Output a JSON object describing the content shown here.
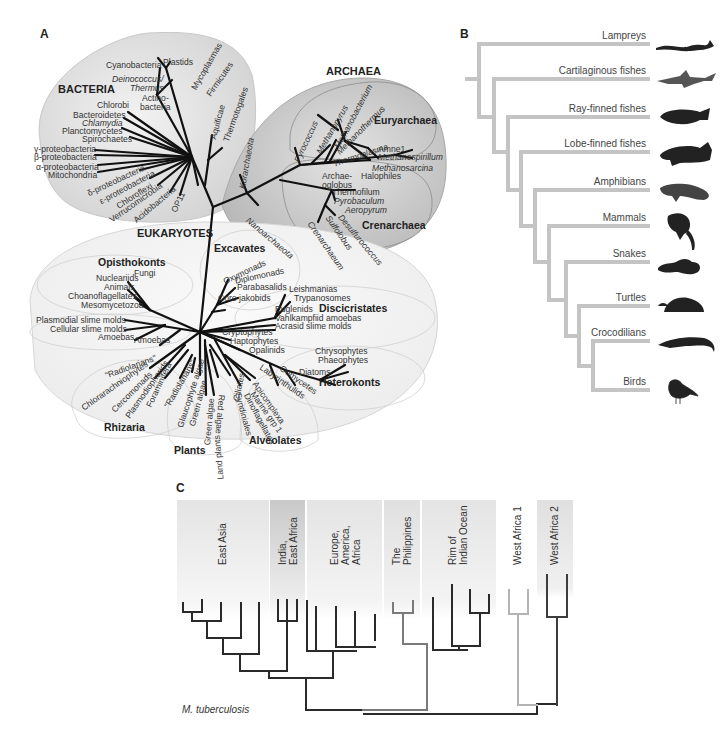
{
  "panels": {
    "A": {
      "letter": "A",
      "domains": {
        "bacteria": {
          "title": "BACTERIA",
          "taxa": [
            "Cyanobacteria",
            "Plastids",
            "Deinococcus/",
            "Thermus",
            "Actino-",
            "bacteria",
            "Mycoplasmas",
            "Firmicutes",
            "Chlorobi",
            "Bacteroidetes",
            "Chlamydia",
            "Planctomycetes",
            "Spirochaetes",
            "γ-proteobacteria",
            "β-proteobacteria",
            "α-proteobacteria",
            "Mitochondria",
            "δ-proteobacteria",
            "ε-proteobacteria",
            "Chloroflexi",
            "Verrucomicrobia",
            "Acidobacteria",
            "OP11",
            "Aquificae",
            "Thermotogales"
          ]
        },
        "archaea": {
          "title": "ARCHAEA",
          "euryarchaea": {
            "title": "Euryarchaea",
            "taxa": [
              "Pyrococcus",
              "Methanopyrus",
              "Methanobacterium",
              "Methanothermus",
              "Thermoplasma",
              "Amne1",
              "Methanospirillum",
              "Methanosarcina",
              "Halophiles",
              "Archae-",
              "oglobus"
            ]
          },
          "crenarchaea": {
            "title": "Crenarchaea",
            "taxa": [
              "Thermofilum",
              "Pyrobaculum",
              "Aeropyrum",
              "Desulfurococcus",
              "Sulfolobus",
              "Crenarchaeum"
            ]
          },
          "other": [
            "Korarchaeota",
            "Nanoarchaeota"
          ]
        },
        "eukaryotes": {
          "title": "EUKARYOTES",
          "opisthokonts": {
            "title": "Opisthokonts",
            "taxa": [
              "Nucleariids",
              "Fungi",
              "Animals",
              "Choanoflagellates",
              "Mesomycetozoa"
            ]
          },
          "amoebozoa": {
            "taxa": [
              "Plasmodial slime molds",
              "Cellular slime molds",
              "Amoebas",
              "Amoebas"
            ]
          },
          "excavates": {
            "title": "Excavates",
            "taxa": [
              "Oxymonads",
              "Diplomonads",
              "Parabasalids",
              "Core jakobids"
            ]
          },
          "discicristates": {
            "title": "Discicristates",
            "taxa": [
              "Leishmanias",
              "Trypanosomes",
              "Euglenids",
              "Vahlkampfiid amoebas",
              "Acrasid slime molds"
            ]
          },
          "misc": [
            "Cryptophytes",
            "Haptophytes"
          ],
          "heterokonts": {
            "title": "Heterokonts",
            "taxa": [
              "Opalinids",
              "Chrysophytes",
              "Phaeophytes",
              "Diatoms",
              "Oomycetes",
              "Labyrinthulids"
            ]
          },
          "rhizaria": {
            "title": "Rhizaria",
            "taxa": [
              "\"Radiolarians\"",
              "Chlorarachniophytes",
              "Cercomonads",
              "Plasmodiophorids",
              "Foraminifera",
              "\"Radiolarians\""
            ]
          },
          "plants": {
            "title": "Plants",
            "taxa": [
              "Glaucophyte algae",
              "Green algae",
              "Green algae",
              "Land plants",
              "Red algae"
            ]
          },
          "alveolates": {
            "title": "Alveolates",
            "taxa": [
              "Ciliates",
              "Apicomplexa",
              "Marine grp 1",
              "Dinoflagellates",
              "Syndiniales"
            ]
          }
        }
      }
    },
    "B": {
      "letter": "B",
      "taxa": [
        {
          "label": "Lampreys",
          "icon": "lamprey-icon"
        },
        {
          "label": "Cartilaginous fishes",
          "icon": "shark-icon"
        },
        {
          "label": "Ray-finned fishes",
          "icon": "fish-icon"
        },
        {
          "label": "Lobe-finned fishes",
          "icon": "coelacanth-icon"
        },
        {
          "label": "Amphibians",
          "icon": "salamander-icon"
        },
        {
          "label": "Mammals",
          "icon": "monkey-icon"
        },
        {
          "label": "Snakes",
          "icon": "snake-icon"
        },
        {
          "label": "Turtles",
          "icon": "turtle-icon"
        },
        {
          "label": "Crocodilians",
          "icon": "crocodile-icon"
        },
        {
          "label": "Birds",
          "icon": "bird-icon"
        }
      ],
      "line_color": "#c4c4c4"
    },
    "C": {
      "letter": "C",
      "organism": "M. tuberculosis",
      "regions": [
        {
          "label": "East Asia"
        },
        {
          "label": "India,\nEast Africa"
        },
        {
          "label": "Europe,\nAmerica,\nAfrica"
        },
        {
          "label": "The\nPhilippines"
        },
        {
          "label": "Rim of\nIndian Ocean"
        },
        {
          "label": "West Africa 1"
        },
        {
          "label": "West Africa 2"
        }
      ],
      "colors": {
        "dark": "#2a2a2a",
        "mid": "#7a7a7a",
        "light": "#b8b8b8",
        "region_bg": "#e6e6e6",
        "region_dark": "#cfcfcf"
      }
    }
  }
}
